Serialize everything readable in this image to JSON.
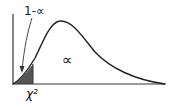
{
  "diagram": {
    "labels": {
      "lower_tail": "1-∝",
      "upper_region": "∝",
      "cutoff": "χ²"
    },
    "colors": {
      "curve": "#222222",
      "shaded_region": "#555555",
      "axis": "#333333"
    }
  }
}
